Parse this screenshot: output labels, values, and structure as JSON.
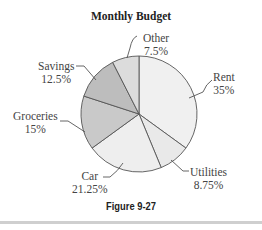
{
  "chart_data": {
    "type": "pie",
    "title": "Monthly Budget",
    "caption": "Figure 9-27",
    "start_angle": "12 o'clock, clockwise",
    "slices": [
      {
        "label": "Rent",
        "value": 35,
        "display": "35%",
        "color": "#f0f0f0"
      },
      {
        "label": "Utilities",
        "value": 8.75,
        "display": "8.75%",
        "color": "#e9e9e9"
      },
      {
        "label": "Car",
        "value": 21.25,
        "display": "21.25%",
        "color": "#eeeeee"
      },
      {
        "label": "Groceries",
        "value": 15,
        "display": "15%",
        "color": "#c9c9c9"
      },
      {
        "label": "Savings",
        "value": 12.5,
        "display": "12.5%",
        "color": "#bdbdbd"
      },
      {
        "label": "Other",
        "value": 7.5,
        "display": "7.5%",
        "color": "#dcdcdc"
      }
    ],
    "legend": "none (callout labels)"
  },
  "labels": {
    "rent": {
      "name": "Rent",
      "pct": "35%"
    },
    "utilities": {
      "name": "Utilities",
      "pct": "8.75%"
    },
    "car": {
      "name": "Car",
      "pct": "21.25%"
    },
    "groceries": {
      "name": "Groceries",
      "pct": "15%"
    },
    "savings": {
      "name": "Savings",
      "pct": "12.5%"
    },
    "other": {
      "name": "Other",
      "pct": "7.5%"
    }
  }
}
